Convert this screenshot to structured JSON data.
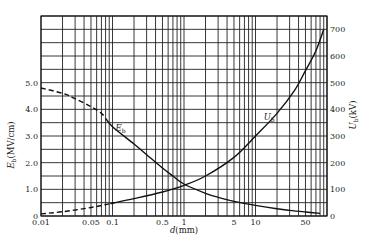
{
  "chart_data": {
    "type": "line",
    "title": "",
    "xlabel": "d(mm)",
    "ylabel_left": "E_b(MV/cm)",
    "ylabel_right": "U_b(kV)",
    "xscale": "log",
    "xlim": [
      0.01,
      100
    ],
    "ylim_left": [
      0,
      7.5
    ],
    "ylim_right": [
      0,
      750
    ],
    "grid": true,
    "x_tick_labels": [
      "0.01",
      "0.05",
      "0.1",
      "0.5",
      "1",
      "5",
      "10",
      "50"
    ],
    "x_tick_values": [
      0.01,
      0.05,
      0.1,
      0.5,
      1,
      5,
      10,
      50
    ],
    "y_left_tick_labels": [
      "0",
      "1.0",
      "2.0",
      "3.0",
      "4.0",
      "5.0"
    ],
    "y_left_tick_values": [
      0,
      1,
      2,
      3,
      4,
      5
    ],
    "y_right_tick_labels": [
      "0",
      "100",
      "200",
      "300",
      "400",
      "500",
      "600",
      "700"
    ],
    "y_right_tick_values": [
      0,
      100,
      200,
      300,
      400,
      500,
      600,
      700
    ],
    "series": [
      {
        "name": "E_b",
        "axis": "left",
        "unit": "MV/cm",
        "dashed_until_x": 0.08,
        "x": [
          0.01,
          0.02,
          0.03,
          0.05,
          0.07,
          0.1,
          0.2,
          0.3,
          0.5,
          0.7,
          1,
          2,
          3,
          5,
          10,
          20,
          30,
          50,
          80
        ],
        "values": [
          4.8,
          4.6,
          4.4,
          4.1,
          3.85,
          3.35,
          2.7,
          2.3,
          1.8,
          1.5,
          1.2,
          0.85,
          0.7,
          0.55,
          0.4,
          0.27,
          0.21,
          0.15,
          0.1
        ]
      },
      {
        "name": "U_b",
        "axis": "right",
        "unit": "kV",
        "dashed_until_x": 0.1,
        "x": [
          0.01,
          0.02,
          0.05,
          0.1,
          0.2,
          0.5,
          1,
          2,
          5,
          10,
          20,
          35,
          50,
          70,
          90
        ],
        "values": [
          8,
          16,
          32,
          48,
          65,
          90,
          115,
          150,
          220,
          300,
          385,
          470,
          545,
          620,
          700
        ]
      }
    ],
    "annotations": [
      {
        "text": "E",
        "sub": "b",
        "x": 0.11,
        "y_left": 3.2
      },
      {
        "text": "U",
        "sub": "b",
        "x": 13,
        "y_left": 3.6
      }
    ],
    "legend": "none"
  },
  "labels": {
    "xlabel_italic": "d",
    "xlabel_rest": "(mm)",
    "ylabel_left_main": "E",
    "ylabel_left_sub": "b",
    "ylabel_left_rest": "(MV/cm)",
    "ylabel_right_main": "U",
    "ylabel_right_sub": "b",
    "ylabel_right_rest": "(kV)"
  }
}
